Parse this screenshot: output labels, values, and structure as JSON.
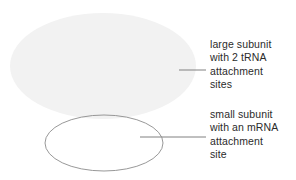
{
  "diagram": {
    "background_color": "#ffffff",
    "shapes": {
      "large_subunit": {
        "name": "large subunit",
        "fill_color": "#f2f2f2",
        "stroke_color": "none",
        "cx": 103,
        "cy": 66,
        "rx": 93,
        "ry": 53
      },
      "small_subunit": {
        "name": "small subunit",
        "fill_color": "#ffffff",
        "stroke_color": "#8c8c8c",
        "cx": 104,
        "cy": 143,
        "rx": 59,
        "ry": 28
      }
    },
    "leaders": {
      "large_leader": {
        "color": "#808080",
        "x1": 179,
        "y1": 70,
        "x2": 206,
        "y2": 70
      },
      "small_leader": {
        "color": "#808080",
        "x1": 140,
        "y1": 137,
        "x2": 206,
        "y2": 137
      }
    }
  },
  "labels": {
    "large_subunit": {
      "line1": "large subunit",
      "line2": "with 2 tRNA",
      "line3": "attachment",
      "line4": "sites"
    },
    "small_subunit": {
      "line1": "small subunit",
      "line2": "with an mRNA",
      "line3": "attachment",
      "line4": "site"
    }
  }
}
